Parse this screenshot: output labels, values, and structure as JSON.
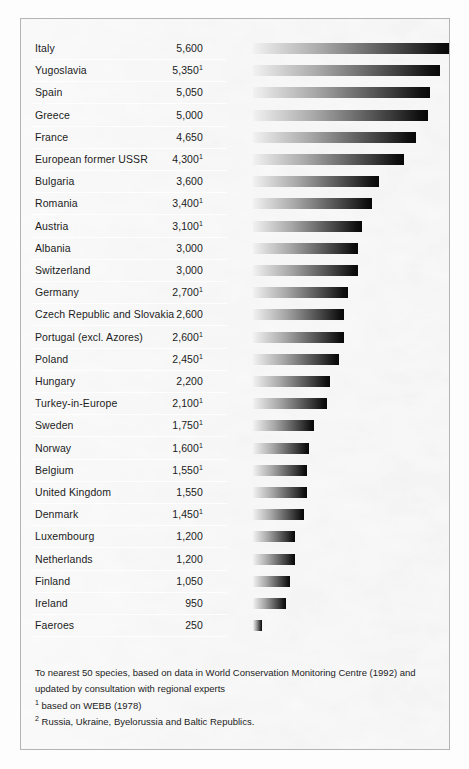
{
  "chart_data": {
    "type": "bar",
    "title": "",
    "subtitle": "",
    "xlabel": "",
    "ylabel": "",
    "orientation": "horizontal",
    "grid": false,
    "legend": "none",
    "xlim": [
      0,
      5600
    ],
    "value_unit": "species",
    "categories": [
      "Italy",
      "Yugoslavia",
      "Spain",
      "Greece",
      "France",
      "European former USSR",
      "Bulgaria",
      "Romania",
      "Austria",
      "Albania",
      "Switzerland",
      "Germany",
      "Czech Republic and Slovakia",
      "Portugal (excl. Azores)",
      "Poland",
      "Hungary",
      "Turkey-in-Europe",
      "Sweden",
      "Norway",
      "Belgium",
      "United Kingdom",
      "Denmark",
      "Luxembourg",
      "Netherlands",
      "Finland",
      "Ireland",
      "Faeroes"
    ],
    "values": [
      5600,
      5350,
      5050,
      5000,
      4650,
      4300,
      3600,
      3400,
      3100,
      3000,
      3000,
      2700,
      2600,
      2600,
      2450,
      2200,
      2100,
      1750,
      1600,
      1550,
      1550,
      1450,
      1200,
      1200,
      1050,
      950,
      250
    ],
    "value_labels": [
      "5,600",
      "5,350",
      "5,050",
      "5,000",
      "4,650",
      "4,300",
      "3,600",
      "3,400",
      "3,100",
      "3,000",
      "3,000",
      "2,700",
      "2,600",
      "2,600",
      "2,450",
      "2,200",
      "2,100",
      "1,750",
      "1,600",
      "1,550",
      "1,550",
      "1,450",
      "1,200",
      "1,200",
      "1,050",
      "950",
      "250"
    ],
    "value_footnote_marks": [
      "",
      "1",
      "",
      "",
      "",
      "1",
      "",
      "1",
      "1",
      "",
      "",
      "1",
      "",
      "1",
      "1",
      "",
      "1",
      "1",
      "1",
      "1",
      "",
      "1",
      "",
      "",
      "",
      "",
      ""
    ],
    "category_footnote_marks": [
      "",
      "",
      "",
      "",
      "",
      "2",
      "",
      "",
      "",
      "",
      "",
      "",
      "",
      "",
      "",
      "",
      "",
      "",
      "",
      "",
      "",
      "",
      "",
      "",
      "",
      "",
      ""
    ]
  },
  "rows": [
    {
      "country": "Italy",
      "sup_country": "",
      "value": "5,600",
      "sup_value": "",
      "num": 5600
    },
    {
      "country": "Yugoslavia",
      "sup_country": "",
      "value": "5,350",
      "sup_value": "1",
      "num": 5350
    },
    {
      "country": "Spain",
      "sup_country": "",
      "value": "5,050",
      "sup_value": "",
      "num": 5050
    },
    {
      "country": "Greece",
      "sup_country": "",
      "value": "5,000",
      "sup_value": "",
      "num": 5000
    },
    {
      "country": "France",
      "sup_country": "",
      "value": "4,650",
      "sup_value": "",
      "num": 4650
    },
    {
      "country": "European former USSR",
      "sup_country": "2",
      "value": "4,300",
      "sup_value": "1",
      "num": 4300
    },
    {
      "country": "Bulgaria",
      "sup_country": "",
      "value": "3,600",
      "sup_value": "",
      "num": 3600
    },
    {
      "country": "Romania",
      "sup_country": "",
      "value": "3,400",
      "sup_value": "1",
      "num": 3400
    },
    {
      "country": "Austria",
      "sup_country": "",
      "value": "3,100",
      "sup_value": "1",
      "num": 3100
    },
    {
      "country": "Albania",
      "sup_country": "",
      "value": "3,000",
      "sup_value": "",
      "num": 3000
    },
    {
      "country": "Switzerland",
      "sup_country": "",
      "value": "3,000",
      "sup_value": "",
      "num": 3000
    },
    {
      "country": "Germany",
      "sup_country": "",
      "value": "2,700",
      "sup_value": "1",
      "num": 2700
    },
    {
      "country": "Czech Republic and Slovakia",
      "sup_country": "",
      "value": "2,600",
      "sup_value": "",
      "num": 2600
    },
    {
      "country": "Portugal (excl. Azores)",
      "sup_country": "",
      "value": "2,600",
      "sup_value": "1",
      "num": 2600
    },
    {
      "country": "Poland",
      "sup_country": "",
      "value": "2,450",
      "sup_value": "1",
      "num": 2450
    },
    {
      "country": "Hungary",
      "sup_country": "",
      "value": "2,200",
      "sup_value": "",
      "num": 2200
    },
    {
      "country": "Turkey-in-Europe",
      "sup_country": "",
      "value": "2,100",
      "sup_value": "1",
      "num": 2100
    },
    {
      "country": "Sweden",
      "sup_country": "",
      "value": "1,750",
      "sup_value": "1",
      "num": 1750
    },
    {
      "country": "Norway",
      "sup_country": "",
      "value": "1,600",
      "sup_value": "1",
      "num": 1600
    },
    {
      "country": "Belgium",
      "sup_country": "",
      "value": "1,550",
      "sup_value": "1",
      "num": 1550
    },
    {
      "country": "United Kingdom",
      "sup_country": "",
      "value": "1,550",
      "sup_value": "",
      "num": 1550
    },
    {
      "country": "Denmark",
      "sup_country": "",
      "value": "1,450",
      "sup_value": "1",
      "num": 1450
    },
    {
      "country": "Luxembourg",
      "sup_country": "",
      "value": "1,200",
      "sup_value": "",
      "num": 1200
    },
    {
      "country": "Netherlands",
      "sup_country": "",
      "value": "1,200",
      "sup_value": "",
      "num": 1200
    },
    {
      "country": "Finland",
      "sup_country": "",
      "value": "1,050",
      "sup_value": "",
      "num": 1050
    },
    {
      "country": "Ireland",
      "sup_country": "",
      "value": "950",
      "sup_value": "",
      "num": 950
    },
    {
      "country": "Faeroes",
      "sup_country": "",
      "value": "250",
      "sup_value": "",
      "num": 250
    }
  ],
  "footnotes": {
    "source_line1": "To nearest 50 species, based on data in World Conservation Monitoring Centre (1992) and",
    "source_line2": "updated by consultation with regional experts",
    "note1_mark": "1",
    "note1_text": "based on WEBB (1978)",
    "note2_mark": "2",
    "note2_text": "Russia, Ukraine, Byelorussia and Baltic Republics."
  },
  "style": {
    "bar_gradient_start": "#f2f2f2",
    "bar_gradient_end": "#080808",
    "frame_border": "#b4b4b4",
    "text_color": "#1c1c1c",
    "panel_background": "#fbfbfb"
  }
}
